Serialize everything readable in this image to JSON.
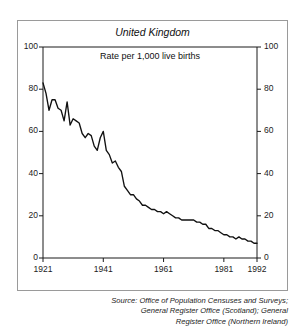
{
  "figure": {
    "panel_title": "United Kingdom",
    "unit_label": "Rate per 1,000 live births",
    "source_lines": [
      "Source: Office of Population Censuses and Surveys;",
      "General Register Office (Scotland); General",
      "Register Office (Northern Ireland)"
    ]
  },
  "axis": {
    "y_left": [
      "100",
      "80",
      "60",
      "40",
      "20",
      "0"
    ],
    "y_right": [
      "100",
      "80",
      "60",
      "40",
      "20",
      "0"
    ],
    "x": [
      "1921",
      "1941",
      "1961",
      "1981",
      "1992"
    ]
  },
  "colors": {
    "line": "#111111",
    "axis": "#1a1a1a",
    "frame": "#9a9a9a",
    "background": "#ffffff"
  },
  "chart_data": {
    "type": "line",
    "title": "United Kingdom",
    "subtitle": "Rate per 1,000 live births",
    "xlabel": "",
    "ylabel": "Rate per 1,000 live births",
    "xlim": [
      1921,
      1992
    ],
    "ylim": [
      0,
      100
    ],
    "ytick_values": [
      0,
      20,
      40,
      60,
      80,
      100
    ],
    "xtick_values": [
      1921,
      1941,
      1961,
      1981,
      1992
    ],
    "grid": false,
    "legend": "none",
    "series": [
      {
        "name": "Infant mortality rate",
        "x": [
          1921,
          1922,
          1923,
          1924,
          1925,
          1926,
          1927,
          1928,
          1929,
          1930,
          1931,
          1932,
          1933,
          1934,
          1935,
          1936,
          1937,
          1938,
          1939,
          1940,
          1941,
          1942,
          1943,
          1944,
          1945,
          1946,
          1947,
          1948,
          1949,
          1950,
          1951,
          1952,
          1953,
          1954,
          1955,
          1956,
          1957,
          1958,
          1959,
          1960,
          1961,
          1962,
          1963,
          1964,
          1965,
          1966,
          1967,
          1968,
          1969,
          1970,
          1971,
          1972,
          1973,
          1974,
          1975,
          1976,
          1977,
          1978,
          1979,
          1980,
          1981,
          1982,
          1983,
          1984,
          1985,
          1986,
          1987,
          1988,
          1989,
          1990,
          1991,
          1992
        ],
        "values": [
          83,
          78,
          70,
          75,
          75,
          71,
          70,
          65,
          74,
          63,
          66,
          65,
          64,
          59,
          57,
          59,
          58,
          53,
          51,
          57,
          60,
          51,
          49,
          45,
          46,
          43,
          41,
          34,
          32,
          30,
          30,
          28,
          27,
          25,
          25,
          24,
          23,
          23,
          22,
          22,
          21,
          22,
          21,
          20,
          19,
          19,
          18,
          18,
          18,
          18,
          18,
          17,
          17,
          16,
          16,
          14,
          14,
          13,
          13,
          12,
          11,
          11,
          10,
          10,
          9,
          10,
          9,
          9,
          8,
          8,
          7,
          7
        ]
      }
    ]
  }
}
